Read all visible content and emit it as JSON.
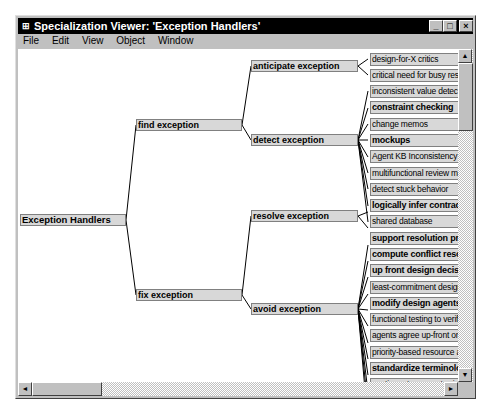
{
  "window": {
    "title": "Specialization Viewer: 'Exception Handlers'",
    "app_icon": "app-icon",
    "buttons": {
      "minimize": "_",
      "maximize": "□",
      "close": "×"
    }
  },
  "menu": [
    "File",
    "Edit",
    "View",
    "Object",
    "Window"
  ],
  "tree": {
    "root": "Exception Handlers",
    "level1": [
      "find exception",
      "fix exception"
    ],
    "level2": [
      "anticipate exception",
      "detect exception",
      "resolve exception",
      "avoid exception"
    ],
    "leaves": [
      {
        "label": "design-for-X critics",
        "bold": false,
        "parent": "anticipate exception"
      },
      {
        "label": "critical need for busy resources",
        "bold": false,
        "parent": "anticipate exception"
      },
      {
        "label": "inconsistent value detection",
        "bold": false,
        "parent": "detect exception"
      },
      {
        "label": "constraint checking",
        "bold": true,
        "parent": "detect exception"
      },
      {
        "label": "change memos",
        "bold": false,
        "parent": "detect exception"
      },
      {
        "label": "mockups",
        "bold": true,
        "parent": "detect exception"
      },
      {
        "label": "Agent KB Inconsistency Detect",
        "bold": false,
        "parent": "detect exception"
      },
      {
        "label": "multifunctional review meetings",
        "bold": false,
        "parent": "detect exception"
      },
      {
        "label": "detect stuck behavior",
        "bold": false,
        "parent": "detect exception"
      },
      {
        "label": "logically infer contradiction",
        "bold": true,
        "parent": "detect exception"
      },
      {
        "label": "shared database",
        "bold": false,
        "parent": "detect exception"
      },
      {
        "label": "support resolution process",
        "bold": true,
        "parent": "resolve exception"
      },
      {
        "label": "compute conflict resolution",
        "bold": true,
        "parent": "resolve exception"
      },
      {
        "label": "up front design decisions",
        "bold": true,
        "parent": "avoid exception"
      },
      {
        "label": "least-commitment design",
        "bold": false,
        "parent": "avoid exception"
      },
      {
        "label": "modify design agents",
        "bold": true,
        "parent": "avoid exception"
      },
      {
        "label": "functional testing to verify services",
        "bold": false,
        "parent": "avoid exception"
      },
      {
        "label": "agents agree up-front on coordination",
        "bold": false,
        "parent": "avoid exception"
      },
      {
        "label": "priority-based resource allocation",
        "bold": false,
        "parent": "avoid exception"
      },
      {
        "label": "standardize terminology",
        "bold": true,
        "parent": "avoid exception"
      },
      {
        "label": "contingent payments via trustee",
        "bold": false,
        "parent": "avoid exception"
      },
      {
        "label": "suppress dysfunctional instincts",
        "bold": false,
        "parent": "avoid exception"
      },
      {
        "label": "assess impact before propagation",
        "bold": true,
        "parent": "avoid exception"
      },
      {
        "label": "content-based routing",
        "bold": true,
        "parent": "avoid exception"
      },
      {
        "label": "compare cognitive maps",
        "bold": false,
        "parent": "avoid exception"
      }
    ]
  },
  "scrollbars": {
    "up": "▲",
    "down": "▼",
    "left": "◄",
    "right": "►"
  }
}
